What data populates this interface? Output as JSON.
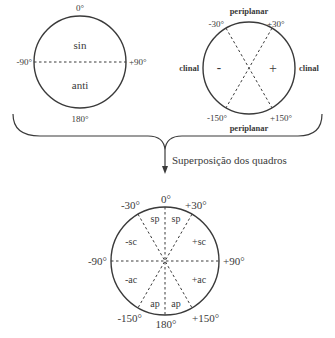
{
  "diagram1": {
    "top": "0°",
    "left": "-90°",
    "right": "+90°",
    "bottom": "180°",
    "upper_region": "sin",
    "lower_region": "anti"
  },
  "diagram2": {
    "top_label": "periplanar",
    "bottom_label": "periplanar",
    "left_label": "clinal",
    "right_label": "clinal",
    "minus_sign": "-",
    "plus_sign": "+",
    "angle_tl": "-30°",
    "angle_tr": "+30°",
    "angle_bl": "-150°",
    "angle_br": "+150°"
  },
  "arrow_label": "Superposição dos quadros",
  "diagram3": {
    "top": "0°",
    "tl": "-30°",
    "tr": "+30°",
    "left": "-90°",
    "right": "+90°",
    "bl": "-150°",
    "br": "+150°",
    "bottom": "180°",
    "regions": {
      "sp_left": "sp",
      "sp_right": "sp",
      "sc_left": "-sc",
      "sc_right": "+sc",
      "ac_left": "-ac",
      "ac_right": "+ac",
      "ap_left": "ap",
      "ap_right": "ap"
    }
  }
}
